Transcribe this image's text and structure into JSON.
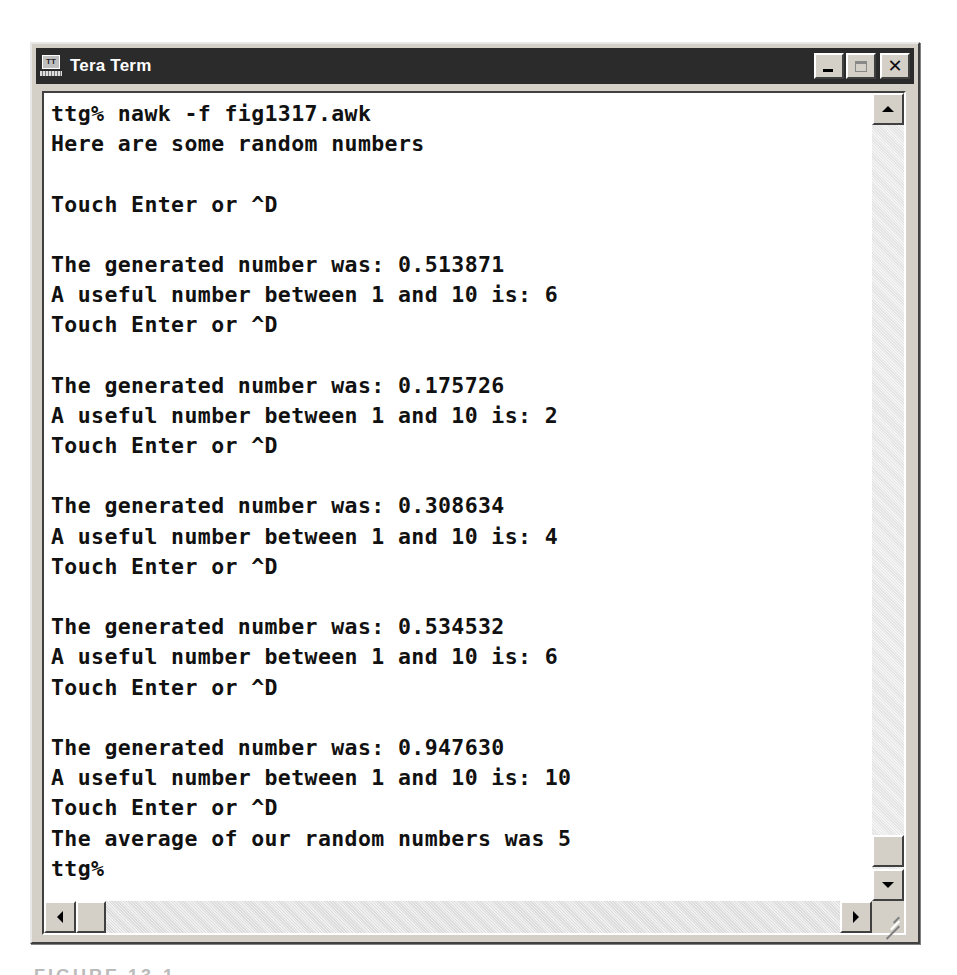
{
  "window": {
    "title": "Tera Term",
    "app_icon": "tera-term-icon",
    "app_icon_label": "TT",
    "controls": {
      "minimize": "minimize-icon",
      "maximize": "maximize-icon",
      "close_label": "✕"
    }
  },
  "terminal": {
    "lines": [
      "ttg% nawk -f fig1317.awk",
      "Here are some random numbers",
      "",
      "Touch Enter or ^D",
      "",
      "The generated number was: 0.513871",
      "A useful number between 1 and 10 is: 6",
      "Touch Enter or ^D",
      "",
      "The generated number was: 0.175726",
      "A useful number between 1 and 10 is: 2",
      "Touch Enter or ^D",
      "",
      "The generated number was: 0.308634",
      "A useful number between 1 and 10 is: 4",
      "Touch Enter or ^D",
      "",
      "The generated number was: 0.534532",
      "A useful number between 1 and 10 is: 6",
      "Touch Enter or ^D",
      "",
      "The generated number was: 0.947630",
      "A useful number between 1 and 10 is: 10",
      "Touch Enter or ^D",
      "The average of our random numbers was 5",
      "ttg%"
    ],
    "prompt": "ttg%"
  },
  "scrollbars": {
    "vertical": {
      "position": "bottom"
    },
    "horizontal": {
      "position": "left"
    }
  },
  "caption": "FIGURE 13-1"
}
